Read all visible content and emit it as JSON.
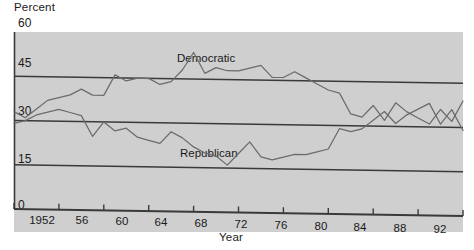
{
  "chart_data": {
    "type": "line",
    "title": "",
    "xlabel": "Year",
    "ylabel": "Percent",
    "ylim": [
      0,
      60
    ],
    "xlim": [
      1952,
      1992
    ],
    "yticks": [
      0,
      15,
      30,
      45,
      60
    ],
    "ytick_labels": [
      "0",
      "15",
      "30",
      "45",
      "60"
    ],
    "xticks": [
      1952,
      1956,
      1960,
      1964,
      1968,
      1972,
      1976,
      1980,
      1984,
      1988,
      1992
    ],
    "xtick_labels": [
      "1952",
      "56",
      "60",
      "64",
      "68",
      "72",
      "76",
      "80",
      "84",
      "88",
      "92"
    ],
    "grid": "horizontal",
    "legend_position": "inline-annotation",
    "background_color": "#cfcfcf",
    "line_color": "#6b6b6b",
    "axis_color": "#3a3a3a",
    "series": [
      {
        "name": "Democratic",
        "x": [
          1952,
          1953,
          1954,
          1955,
          1956,
          1957,
          1958,
          1959,
          1960,
          1961,
          1962,
          1963,
          1964,
          1965,
          1966,
          1967,
          1968,
          1969,
          1970,
          1971,
          1972,
          1973,
          1974,
          1975,
          1976,
          1977,
          1978,
          1979,
          1980,
          1981,
          1982,
          1983,
          1984,
          1985,
          1986,
          1987,
          1988,
          1989,
          1990,
          1991,
          1992
        ],
        "values": [
          33,
          31,
          34,
          37,
          38,
          39,
          41,
          39,
          39,
          46,
          44,
          45,
          45,
          43,
          44,
          48,
          54,
          47,
          49,
          48,
          48,
          49,
          50,
          46,
          46,
          48,
          46,
          44,
          42,
          41,
          34,
          33,
          37,
          32,
          38,
          35,
          33,
          31,
          36,
          32,
          39
        ],
        "color": "#6b6b6b"
      },
      {
        "name": "Republican",
        "x": [
          1952,
          1953,
          1954,
          1955,
          1956,
          1957,
          1958,
          1959,
          1960,
          1961,
          1962,
          1963,
          1964,
          1965,
          1966,
          1967,
          1968,
          1969,
          1970,
          1971,
          1972,
          1973,
          1974,
          1975,
          1976,
          1977,
          1978,
          1979,
          1980,
          1981,
          1982,
          1983,
          1984,
          1985,
          1986,
          1987,
          1988,
          1989,
          1990,
          1991,
          1992
        ],
        "values": [
          29,
          30,
          32,
          33,
          34,
          33,
          32,
          25,
          30,
          27,
          28,
          25,
          24,
          23,
          27,
          25,
          22,
          20,
          19,
          16,
          20,
          24,
          19,
          18,
          19,
          20,
          20,
          21,
          22,
          29,
          28,
          29,
          32,
          35,
          31,
          34,
          36,
          38,
          31,
          36,
          29
        ],
        "color": "#6b6b6b"
      }
    ],
    "annotations": [
      {
        "text": "Democratic",
        "x": 1968,
        "y": 48
      },
      {
        "text": "Republican",
        "x": 1969,
        "y": 21
      }
    ]
  },
  "labels": {
    "percent": "Percent",
    "year": "Year",
    "democratic": "Democratic",
    "republican": "Republican"
  }
}
